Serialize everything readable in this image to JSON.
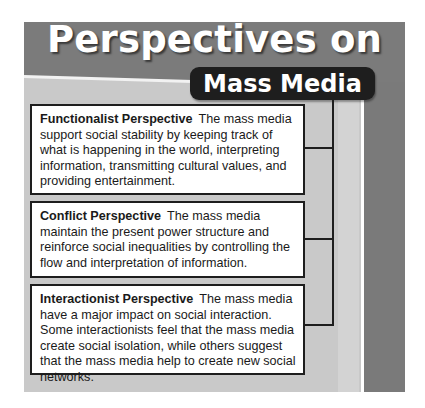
{
  "title": {
    "line1": "Perspectives on",
    "line2": "Mass Media"
  },
  "perspectives": [
    {
      "heading": "Functionalist Perspective",
      "text": "The mass media support social stability by keeping track of what is happening in the world, interpreting information, transmitting cultural values, and providing entertainment."
    },
    {
      "heading": "Conflict Perspective",
      "text": "The mass media maintain the present power structure and reinforce social inequalities by controlling the flow and interpretation of information."
    },
    {
      "heading": "Interactionist Perspective",
      "text": "The mass media have a major impact on social interaction. Some interactionists feel that the mass media create social isolation, while others suggest that the mass media help to create new social networks."
    }
  ],
  "colors": {
    "band": "#7b7b7b",
    "panel": "#c9c9c9",
    "pill": "#1e1e1e",
    "box_border": "#1e1e1e"
  }
}
